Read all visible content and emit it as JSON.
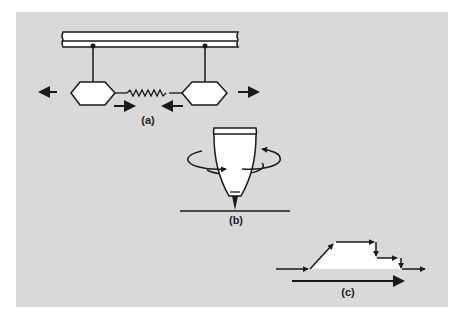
{
  "figure": {
    "background": "#d9d9d9",
    "stroke_color": "#1a1a1a",
    "fill_color": "#ffffff",
    "panels": [
      {
        "id": "a",
        "label": "(a)",
        "description": "Two hexagonal bodies suspended by rods from an overhead beam, connected by a coiled spring; outer arrows point outward, inner arrows point inward"
      },
      {
        "id": "b",
        "label": "(b)",
        "description": "Spinning-top shaped tip above a surface line with a circular rotation arrow around it"
      },
      {
        "id": "c",
        "label": "(c)",
        "description": "Profile path with arrows: flat, rising ramp, plateau, step down, step down, flat exit; long arrow beneath pointing right"
      }
    ]
  }
}
